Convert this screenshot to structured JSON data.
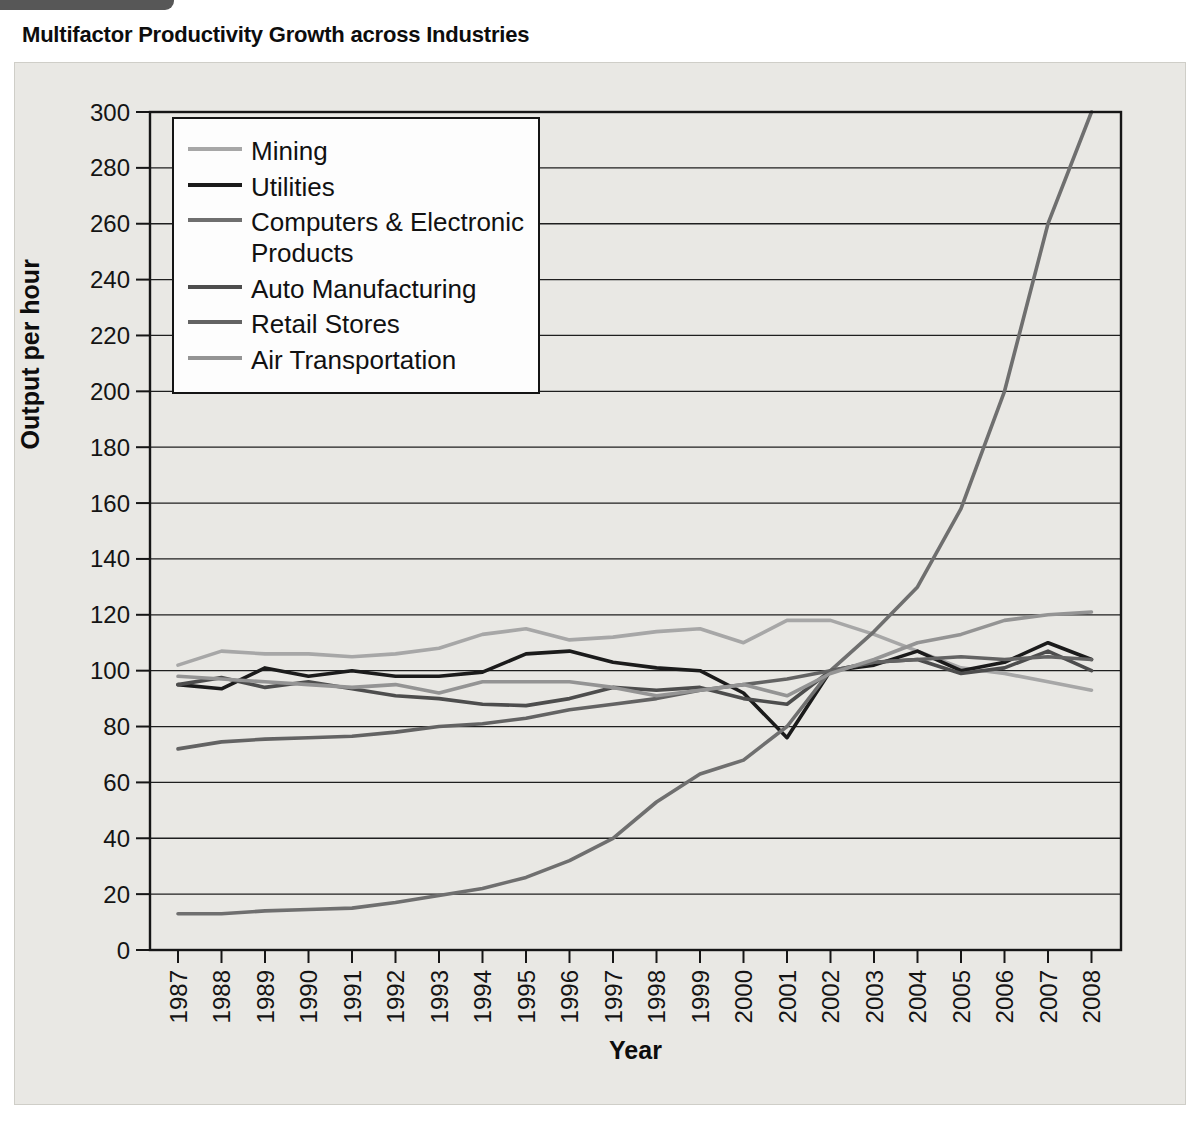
{
  "figure": {
    "title": "Multifactor Productivity Growth across Industries",
    "tab_note": "figure-tab (cropped at top of page)"
  },
  "colors": {
    "panel_bg": "#e9e8e4",
    "plot_border": "#161616",
    "grid": "#1f1f1f",
    "tab": "#575757",
    "legend_bg": "#fdfdfd"
  },
  "chart_data": {
    "type": "line",
    "title": "Multifactor Productivity Growth across Industries",
    "xlabel": "Year",
    "ylabel": "Output per hour",
    "ylim": [
      0,
      300
    ],
    "ytick_step": 20,
    "grid": true,
    "legend_position": "upper-left-inside",
    "x": [
      1987,
      1988,
      1989,
      1990,
      1991,
      1992,
      1993,
      1994,
      1995,
      1996,
      1997,
      1998,
      1999,
      2000,
      2001,
      2002,
      2003,
      2004,
      2005,
      2006,
      2007,
      2008
    ],
    "series": [
      {
        "name": "Mining",
        "color": "#a7a7a7",
        "values": [
          102,
          107,
          106,
          106,
          105,
          106,
          108,
          113,
          115,
          111,
          112,
          114,
          115,
          110,
          118,
          118,
          113,
          107,
          101,
          99,
          96,
          93
        ]
      },
      {
        "name": "Utilities",
        "color": "#1b1b1b",
        "values": [
          95,
          93.5,
          101,
          98,
          100,
          98,
          98,
          99.5,
          106,
          107,
          103,
          101,
          100,
          92,
          76,
          100,
          102,
          107,
          100,
          103,
          110,
          104
        ]
      },
      {
        "name": "Computers & Electronic Products",
        "color": "#6f6f6f",
        "values": [
          13,
          13,
          14,
          14.5,
          15,
          17,
          19.5,
          22,
          26,
          32,
          40,
          53,
          63,
          68,
          80,
          100,
          114,
          130,
          158,
          200,
          260,
          300
        ]
      },
      {
        "name": "Auto Manufacturing",
        "color": "#4d4d4d",
        "values": [
          95,
          97.5,
          94,
          96,
          93.5,
          91,
          90,
          88,
          87.5,
          90,
          94,
          93,
          94,
          90,
          88,
          100,
          103,
          104,
          99,
          101,
          107,
          100
        ]
      },
      {
        "name": "Retail Stores",
        "color": "#636363",
        "values": [
          72,
          74.5,
          75.5,
          76,
          76.5,
          78,
          80,
          81,
          83,
          86,
          88,
          90,
          93,
          95,
          97,
          100,
          103,
          104,
          105,
          104,
          105,
          104
        ]
      },
      {
        "name": "Air Transportation",
        "color": "#949494",
        "values": [
          98,
          97,
          96,
          95,
          94,
          95,
          92,
          96,
          96,
          96,
          94,
          91,
          93,
          95,
          91,
          99,
          104,
          110,
          113,
          118,
          120,
          121
        ]
      }
    ]
  }
}
